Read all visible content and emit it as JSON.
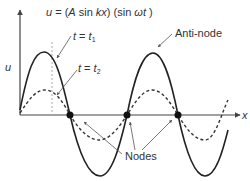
{
  "diagram": {
    "equation": {
      "prefix": "u = (",
      "A": "A",
      "sin_kx": " sin ",
      "kx": "kx",
      "mid": ") (sin ",
      "wt": "ωt",
      "suffix": " )"
    },
    "axes": {
      "y_label": "u",
      "x_label": "x"
    },
    "curves": [
      {
        "name": "t = t1",
        "label_t": "t",
        "label_eq": " = ",
        "label_sub_base": "t",
        "label_sub": "1",
        "style": "solid",
        "amplitude_px": 63
      },
      {
        "name": "t = t2",
        "label_t": "t",
        "label_eq": " = ",
        "label_sub_base": "t",
        "label_sub": "2",
        "style": "dashed",
        "amplitude_px": 25
      }
    ],
    "annotations": {
      "antinode": "Anti-node",
      "nodes": "Nodes"
    },
    "colors": {
      "line": "#222222",
      "axis": "#444444",
      "guide": "#aaaaaa",
      "text": "#333333"
    }
  }
}
